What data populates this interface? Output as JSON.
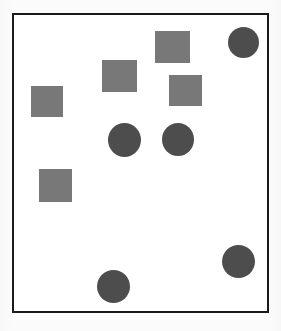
{
  "canvas": {
    "width": 281,
    "height": 331,
    "background_color": "#fbfbfb",
    "title": ""
  },
  "frame": {
    "name": "plot-frame",
    "x": 12,
    "y": 13,
    "width": 257,
    "height": 300,
    "border_width": 2,
    "border_color": "#1a1a1a",
    "fill_color": "#ffffff"
  },
  "palette": {
    "square_fill": "#787878",
    "circle_fill": "#4d4d4d",
    "frame_stroke": "#1a1a1a",
    "page_background": "#fbfbfb"
  },
  "chart_data": {
    "type": "scatter",
    "title": "",
    "xlabel": "",
    "ylabel": "",
    "xlim": [
      0,
      281
    ],
    "ylim": [
      0,
      331
    ],
    "grid": false,
    "legend": false,
    "counts": {
      "squares": 5,
      "circles": 5,
      "total": 10
    },
    "shapes": [
      {
        "id": "square-1",
        "kind": "square",
        "label": "square",
        "color": "#787878",
        "x": 155,
        "y": 31,
        "width": 35,
        "height": 32,
        "cx": 172.5,
        "cy": 47
      },
      {
        "id": "circle-1",
        "kind": "circle",
        "label": "circle",
        "color": "#4d4d4d",
        "x": 228,
        "y": 27,
        "width": 31,
        "height": 31,
        "cx": 243.5,
        "cy": 42.5
      },
      {
        "id": "square-2",
        "kind": "square",
        "label": "square",
        "color": "#787878",
        "x": 102,
        "y": 60,
        "width": 35,
        "height": 32,
        "cx": 119.5,
        "cy": 76
      },
      {
        "id": "square-3",
        "kind": "square",
        "label": "square",
        "color": "#787878",
        "x": 169,
        "y": 75,
        "width": 33,
        "height": 31,
        "cx": 185.5,
        "cy": 90.5
      },
      {
        "id": "square-4",
        "kind": "square",
        "label": "square",
        "color": "#787878",
        "x": 31,
        "y": 86,
        "width": 32,
        "height": 31,
        "cx": 47,
        "cy": 101.5
      },
      {
        "id": "circle-2",
        "kind": "circle",
        "label": "circle",
        "color": "#4d4d4d",
        "x": 108,
        "y": 123,
        "width": 33,
        "height": 34,
        "cx": 124.5,
        "cy": 140
      },
      {
        "id": "circle-3",
        "kind": "circle",
        "label": "circle",
        "color": "#4d4d4d",
        "x": 162,
        "y": 123,
        "width": 32,
        "height": 33,
        "cx": 178,
        "cy": 139.5
      },
      {
        "id": "square-5",
        "kind": "square",
        "label": "square",
        "color": "#787878",
        "x": 39,
        "y": 169,
        "width": 33,
        "height": 33,
        "cx": 55.5,
        "cy": 185.5
      },
      {
        "id": "circle-4",
        "kind": "circle",
        "label": "circle",
        "color": "#4d4d4d",
        "x": 222,
        "y": 245,
        "width": 33,
        "height": 33,
        "cx": 238.5,
        "cy": 261.5
      },
      {
        "id": "circle-5",
        "kind": "circle",
        "label": "circle",
        "color": "#4d4d4d",
        "x": 97,
        "y": 270,
        "width": 33,
        "height": 33,
        "cx": 113.5,
        "cy": 286.5
      }
    ]
  }
}
